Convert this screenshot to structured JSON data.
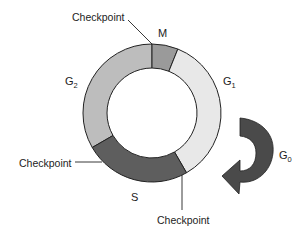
{
  "diagram": {
    "colors": {
      "M": "#9a9a9a",
      "G1": "#e8e8e8",
      "S": "#5e5e5e",
      "G2": "#bdbdbd",
      "G0_arrow": "#4a4a4a",
      "outline": "#222222"
    },
    "phases": [
      {
        "id": "M",
        "label": "M",
        "sub": ""
      },
      {
        "id": "G1",
        "label": "G",
        "sub": "1"
      },
      {
        "id": "S",
        "label": "S",
        "sub": ""
      },
      {
        "id": "G2",
        "label": "G",
        "sub": "2"
      },
      {
        "id": "G0",
        "label": "G",
        "sub": "0"
      }
    ],
    "checkpoints": [
      {
        "label": "Checkpoint",
        "position": "G2/M"
      },
      {
        "label": "Checkpoint",
        "position": "G2/S"
      },
      {
        "label": "Checkpoint",
        "position": "G1/S"
      }
    ]
  }
}
